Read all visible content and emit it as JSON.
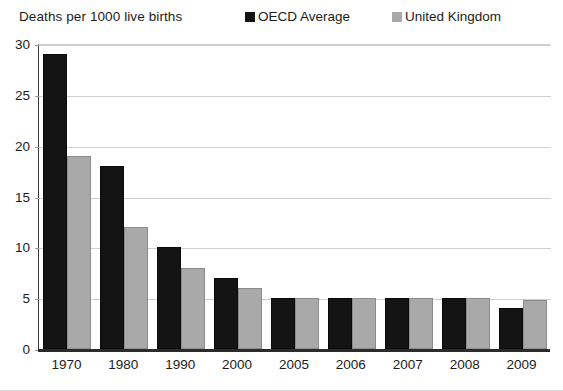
{
  "chart_data": {
    "type": "bar",
    "title": "Deaths per 1000 live births",
    "xlabel": "",
    "ylabel": "Deaths per 1000 live births",
    "categories": [
      "1970",
      "1980",
      "1990",
      "2000",
      "2005",
      "2006",
      "2007",
      "2008",
      "2009"
    ],
    "series": [
      {
        "name": "OECD Average",
        "color": "#141414",
        "values": [
          29,
          18,
          10,
          7,
          5,
          5,
          5,
          5,
          4
        ]
      },
      {
        "name": "United Kingdom",
        "color": "#a9a9a9",
        "values": [
          19,
          12,
          8,
          6,
          5,
          5,
          5,
          5,
          4.8
        ]
      }
    ],
    "ylim": [
      0,
      30
    ],
    "yticks": [
      "0",
      "5",
      "10",
      "15",
      "20",
      "25",
      "30"
    ],
    "ytick_values": [
      0,
      5,
      10,
      15,
      20,
      25,
      30
    ],
    "grid": true,
    "legend_position": "top-right"
  },
  "legend": {
    "items": [
      {
        "label": "OECD Average",
        "color": "#141414"
      },
      {
        "label": "United Kingdom",
        "color": "#a9a9a9"
      }
    ]
  }
}
